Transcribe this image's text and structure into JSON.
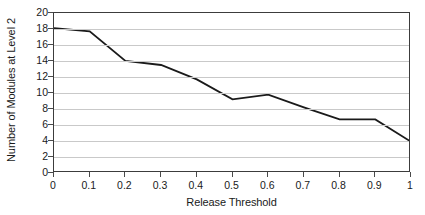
{
  "chart_data": {
    "type": "line",
    "title": "",
    "subtitle": "",
    "xlabel": "Release Threshold",
    "ylabel": "Number of Modules at Level 2",
    "x": [
      0,
      0.1,
      0.2,
      0.3,
      0.4,
      0.5,
      0.6,
      0.7,
      0.8,
      0.9,
      1
    ],
    "values": [
      18.1,
      17.7,
      14.0,
      13.5,
      11.7,
      9.2,
      9.8,
      8.2,
      6.7,
      6.7,
      3.9
    ],
    "series": [
      {
        "name": "Number of Modules at Level 2",
        "values": [
          18.1,
          17.7,
          14.0,
          13.5,
          11.7,
          9.2,
          9.8,
          8.2,
          6.7,
          6.7,
          3.9
        ]
      }
    ],
    "xlim": [
      0,
      1
    ],
    "ylim": [
      0,
      20
    ],
    "x_tick_labels": [
      "0",
      "0.1",
      "0.2",
      "0.3",
      "0.4",
      "0.5",
      "0.6",
      "0.7",
      "0.8",
      "0.9",
      "1"
    ],
    "y_ticks": [
      0,
      2,
      4,
      6,
      8,
      10,
      12,
      14,
      16,
      18,
      20
    ],
    "y_tick_labels": [
      "0",
      "2",
      "4",
      "6",
      "8",
      "10",
      "12",
      "14",
      "16",
      "18",
      "20"
    ],
    "grid": "horizontal",
    "legend": "none",
    "markers": false,
    "colors": {
      "line": "#1a1a1a",
      "gridline": "#c9c9c9",
      "frame": "#3c3c3c",
      "background": "#ffffff",
      "text": "#1a1a1a"
    },
    "line_width": 1.8
  }
}
